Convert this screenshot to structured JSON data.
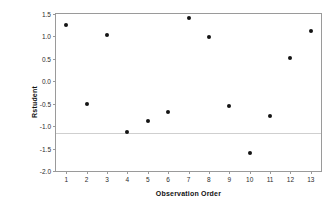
{
  "chart_data": {
    "type": "scatter",
    "title": "",
    "xlabel": "Observation Order",
    "ylabel": "Rstudent",
    "x": [
      1,
      2,
      3,
      4,
      5,
      6,
      7,
      8,
      9,
      10,
      11,
      12,
      13
    ],
    "values": [
      1.26,
      -0.5,
      1.04,
      -1.12,
      -0.89,
      -0.69,
      1.42,
      0.99,
      -0.55,
      -1.6,
      -0.78,
      0.51,
      1.12
    ],
    "xlim": [
      0.5,
      13.5
    ],
    "ylim": [
      -2.0,
      1.5
    ],
    "xticks": [
      1,
      2,
      3,
      4,
      5,
      6,
      7,
      8,
      9,
      10,
      11,
      12,
      13
    ],
    "xtick_labels": [
      "1",
      "2",
      "3",
      "4",
      "5",
      "6",
      "7",
      "8",
      "9",
      "10",
      "11",
      "12",
      "13"
    ],
    "yticks": [
      1.5,
      1.0,
      0.5,
      0.0,
      -0.5,
      -1.0,
      -1.5,
      -2.0
    ],
    "ytick_labels": [
      "1.5",
      "1.0",
      "0.5",
      "0.0",
      "-0.5",
      "-1.0",
      "-1.5",
      "-2.0"
    ],
    "grid": false,
    "legend": "none",
    "reference_lines": [
      {
        "orientation": "horizontal",
        "value": -1.15,
        "color": "#cfcfcf"
      }
    ],
    "marker": {
      "shape": "circle",
      "filled": true,
      "color": "#141414",
      "size_px": 4
    },
    "frame_color": "#9a9a9a",
    "background": "#ffffff"
  }
}
